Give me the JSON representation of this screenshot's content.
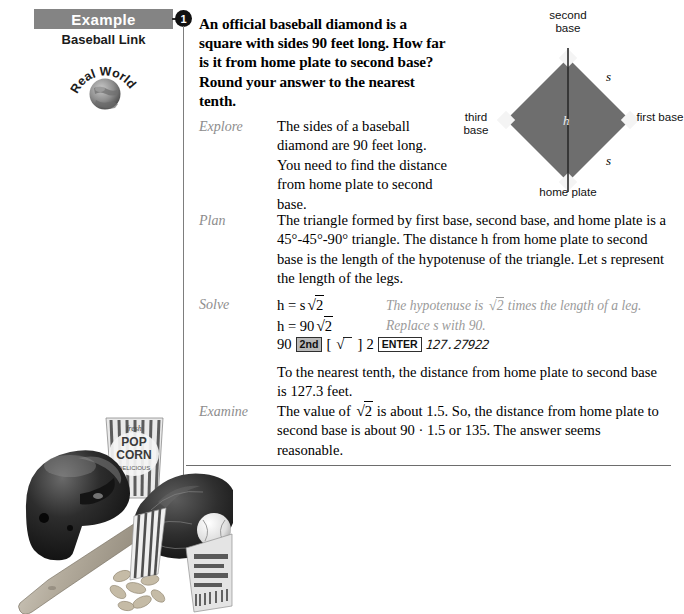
{
  "sidebar": {
    "example_label": "Example",
    "example_number": "1",
    "link_label": "Baseball Link",
    "badge_text": "Real World",
    "badge_icon": "globe-icon"
  },
  "problem": {
    "statement": "An official baseball diamond is a square with sides 90 feet long. How far is it from home plate to second base? Round your answer to the nearest tenth."
  },
  "steps": [
    {
      "label": "Explore",
      "body": "The sides of a baseball diamond are 90 feet long. You need to find the distance from home plate to second base."
    },
    {
      "label": "Plan",
      "body": "The triangle formed by first base, second base, and home plate is a 45°-45°-90° triangle. The distance h from home plate to second base is the length of the hypotenuse of the triangle. Let s represent the length of the legs."
    },
    {
      "label": "Solve",
      "eq1_lhs": "h = s",
      "eq1_radicand": "2",
      "eq1_note_pre": "The hypotenuse is ",
      "eq1_note_radicand": "2",
      "eq1_note_post": " times the length of a leg.",
      "eq2_lhs": "h = 90",
      "eq2_radicand": "2",
      "eq2_note": "Replace s with 90.",
      "calc_operand": "90",
      "calc_key_2nd": "2nd",
      "calc_bracket_open": "[",
      "calc_radical_icon": "square-root-icon",
      "calc_bracket_close": "]",
      "calc_arg": "2",
      "calc_key_enter": "ENTER",
      "calc_result": "127.27922",
      "conclusion": "To the nearest tenth, the distance from home plate to second base is 127.3 feet."
    },
    {
      "label": "Examine",
      "body_pre": "The value of ",
      "body_radicand": "2",
      "body_post": " is about 1.5. So, the distance from home plate to second base is about 90 · 1.5 or 135. The answer seems reasonable."
    }
  ],
  "diagram": {
    "top_label": "second base",
    "bottom_label": "home plate",
    "left_label": "third base",
    "right_label": "first base",
    "hypotenuse_var": "h",
    "side_var_top": "s",
    "side_var_bottom": "s",
    "field_color": "#6e6e6e",
    "base_color": "#f2f2f2"
  },
  "collage": {
    "alt": "baseball-equipment-photo",
    "items": [
      "batting-helmet",
      "popcorn-box",
      "baseball-glove",
      "baseball",
      "baseball-bat",
      "peanuts",
      "ticket"
    ]
  }
}
